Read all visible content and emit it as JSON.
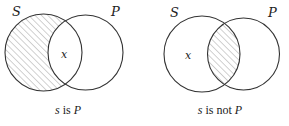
{
  "diagrams": [
    {
      "id": "left",
      "caption_subject": "s",
      "caption_rest": " is ",
      "caption_predicate": "P",
      "circle_s_label": "S",
      "circle_p_label": "P",
      "point_label": "x",
      "shaded_region": "S minus P"
    },
    {
      "id": "right",
      "caption_subject": "s",
      "caption_rest": " is not ",
      "caption_predicate": "P",
      "circle_s_label": "S",
      "circle_p_label": "P",
      "point_label": "x",
      "shaded_region": "S intersect P"
    }
  ],
  "colors": {
    "stroke": "#333333",
    "hatch": "#9a9a9a",
    "background": "#ffffff"
  }
}
